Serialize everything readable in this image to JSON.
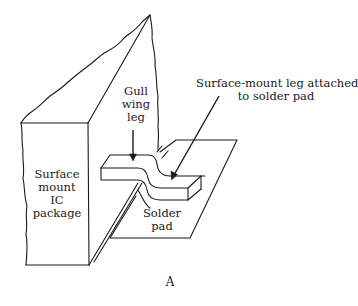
{
  "figure": {
    "caption": "A",
    "labels": {
      "gull_wing_leg": [
        "Gull",
        "wing",
        "leg"
      ],
      "ic_package": [
        "Surface",
        "mount",
        "IC",
        "package"
      ],
      "surface_mount_leg": [
        "Surface-mount leg attached",
        "to solder pad"
      ],
      "solder_pad": [
        "Solder",
        "pad"
      ]
    },
    "colors": {
      "line": "#1a1a1a",
      "background": "#ffffff"
    }
  }
}
